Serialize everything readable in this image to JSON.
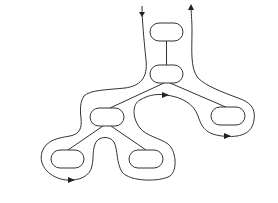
{
  "diagram": {
    "type": "tree-euler-tour",
    "nodes": [
      {
        "id": "root",
        "label": ""
      },
      {
        "id": "n2",
        "label": ""
      },
      {
        "id": "n3",
        "label": ""
      },
      {
        "id": "n4",
        "label": ""
      },
      {
        "id": "n5",
        "label": ""
      },
      {
        "id": "n6",
        "label": ""
      }
    ],
    "edges": [
      {
        "from": "root",
        "to": "n2"
      },
      {
        "from": "n2",
        "to": "n3"
      },
      {
        "from": "n2",
        "to": "n4"
      },
      {
        "from": "n3",
        "to": "n5"
      },
      {
        "from": "n3",
        "to": "n6"
      }
    ],
    "tour": {
      "entry_arrow": "down",
      "exit_arrow": "up",
      "direction_markers": [
        "under-n5",
        "toward-n4",
        "under-n4"
      ]
    },
    "colors": {
      "stroke": "#333333",
      "background": "#ffffff"
    }
  }
}
